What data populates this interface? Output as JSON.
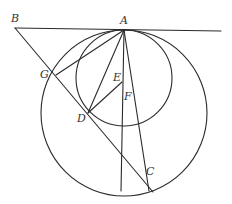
{
  "diagram": {
    "type": "geometry",
    "stroke_color": "#2a2a2a",
    "label_color": "#333333",
    "points": {
      "A": {
        "label": "A",
        "x": 124,
        "y": 30
      },
      "B": {
        "label": "B",
        "x": 15,
        "y": 28
      },
      "C": {
        "label": "C",
        "x": 145,
        "y": 180
      },
      "D": {
        "label": "D",
        "x": 88,
        "y": 113
      },
      "E": {
        "label": "E",
        "x": 122,
        "y": 82
      },
      "F": {
        "label": "F",
        "x": 127,
        "y": 100
      },
      "G": {
        "label": "G",
        "x": 56,
        "y": 75
      }
    },
    "circles": [
      {
        "name": "small-circle",
        "cx": 124,
        "cy": 78,
        "r": 48
      },
      {
        "name": "large-circle",
        "cx": 124,
        "cy": 113,
        "r": 83
      }
    ],
    "segments": [
      {
        "name": "tangent-line-BA",
        "from": "B",
        "to_x": 221,
        "to_y": 31
      },
      {
        "name": "secant-BC",
        "from": "B",
        "to_x": 153,
        "to_y": 192
      },
      {
        "name": "segment-AG",
        "from": "A",
        "to": "G"
      },
      {
        "name": "segment-AD",
        "from": "A",
        "to": "D"
      },
      {
        "name": "segment-DE",
        "from": "D",
        "to": "E"
      },
      {
        "name": "vertical-line-A",
        "from": "A",
        "to_x": 121,
        "to_y": 191
      },
      {
        "name": "line-AFC",
        "from": "A",
        "to_x": 149,
        "to_y": 191
      }
    ],
    "labels": [
      {
        "text": "A",
        "x": 120,
        "y": 24
      },
      {
        "text": "B",
        "x": 11,
        "y": 22
      },
      {
        "text": "C",
        "x": 146,
        "y": 175
      },
      {
        "text": "D",
        "x": 77,
        "y": 122
      },
      {
        "text": "E",
        "x": 113,
        "y": 81
      },
      {
        "text": "F",
        "x": 124,
        "y": 100
      },
      {
        "text": "G",
        "x": 40,
        "y": 78
      }
    ]
  }
}
